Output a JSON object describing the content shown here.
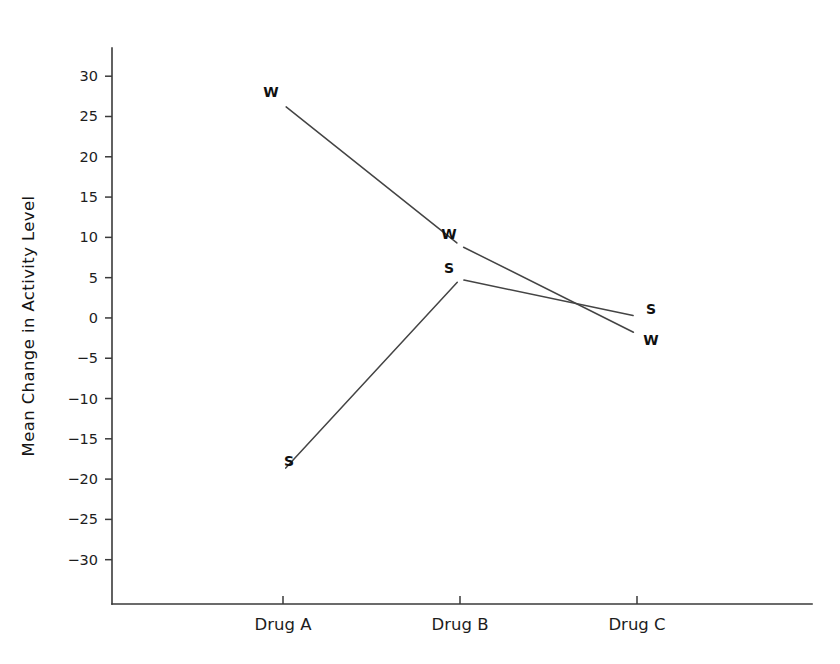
{
  "chart_data": {
    "type": "line",
    "title": "",
    "subtitle": "",
    "xlabel": "",
    "ylabel": "Mean Change in Activity Level",
    "categories": [
      "Drug A",
      "Drug B",
      "Drug C"
    ],
    "series": [
      {
        "name": "W",
        "marker": "W",
        "values": [
          26.5,
          9.0,
          -2.0
        ]
      },
      {
        "name": "S",
        "marker": "S",
        "values": [
          -19.0,
          4.8,
          0.2
        ]
      }
    ],
    "ylim": [
      -35.5,
      33.5
    ],
    "ytick_labels": [
      "30",
      "25",
      "20",
      "15",
      "10",
      "5",
      "0",
      "-5",
      "-10",
      "-15",
      "-20",
      "-25",
      "-30"
    ],
    "yticks": [
      30,
      25,
      20,
      15,
      10,
      5,
      0,
      -5,
      -10,
      -15,
      -20,
      -25,
      -30
    ],
    "grid": false,
    "legend": "none",
    "point_label_offsets": [
      {
        "series": "W",
        "category": "Drug A",
        "dx": -12,
        "dy": -11
      },
      {
        "series": "W",
        "category": "Drug B",
        "dx": -11,
        "dy": -10
      },
      {
        "series": "W",
        "category": "Drug C",
        "dx": 14,
        "dy": 7
      },
      {
        "series": "S",
        "category": "Drug A",
        "dx": 6,
        "dy": -9
      },
      {
        "series": "S",
        "category": "Drug B",
        "dx": -11,
        "dy": -10
      },
      {
        "series": "S",
        "category": "Drug C",
        "dx": 14,
        "dy": -6
      }
    ],
    "colors": {
      "background": "#ffffff",
      "axis": "#3a3a3a",
      "line": "#444444",
      "text": "#1d1d1d"
    }
  }
}
